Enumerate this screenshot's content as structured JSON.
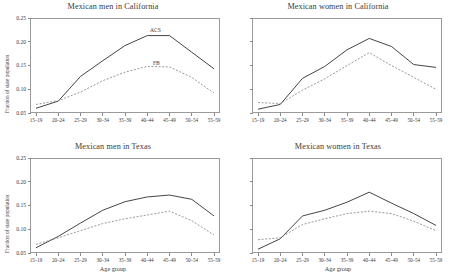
{
  "figure": {
    "xlabel": "Age group",
    "ylabel": "Fraction of state population",
    "series_label_acs": "ACS",
    "series_label_fb": "FB",
    "acs_color": "#3b3b3b",
    "fb_color": "#8d8d8d"
  },
  "chart_data": [
    {
      "type": "line",
      "title": "Mexican men in California",
      "xlabel": "Age group",
      "ylabel": "Fraction of state population",
      "categories": [
        "15–19",
        "20–24",
        "25–29",
        "30–34",
        "35–39",
        "40–44",
        "45–49",
        "50–54",
        "55–59"
      ],
      "ylim": [
        0.05,
        0.25
      ],
      "yticks": [
        0.05,
        0.1,
        0.15,
        0.2,
        0.25
      ],
      "yticklabels": [
        "0.05",
        "0.10",
        "0.15",
        "0.20",
        "0.25"
      ],
      "grid": false,
      "legend": "inline-annotation",
      "series": [
        {
          "name": "ACS",
          "style": "solid",
          "values": [
            0.06,
            0.075,
            0.127,
            0.16,
            0.192,
            0.213,
            0.213,
            0.178,
            0.143
          ]
        },
        {
          "name": "FB",
          "style": "dashed",
          "values": [
            0.068,
            0.076,
            0.094,
            0.118,
            0.136,
            0.148,
            0.147,
            0.125,
            0.092
          ]
        }
      ]
    },
    {
      "type": "line",
      "title": "Mexican women in California",
      "xlabel": "Age group",
      "ylabel": "Fraction of state population",
      "categories": [
        "15–19",
        "20–24",
        "25–29",
        "30–34",
        "35–39",
        "40–44",
        "45–49",
        "50–54",
        "55–59"
      ],
      "ylim": [
        0.05,
        0.25
      ],
      "yticks": [
        0.05,
        0.1,
        0.15,
        0.2,
        0.25
      ],
      "yticklabels": [
        "",
        "",
        "",
        "",
        ""
      ],
      "grid": false,
      "series": [
        {
          "name": "ACS",
          "style": "solid",
          "values": [
            0.058,
            0.068,
            0.123,
            0.148,
            0.183,
            0.207,
            0.19,
            0.152,
            0.146
          ]
        },
        {
          "name": "FB",
          "style": "dashed",
          "values": [
            0.072,
            0.07,
            0.098,
            0.122,
            0.15,
            0.177,
            0.15,
            0.125,
            0.1
          ]
        }
      ]
    },
    {
      "type": "line",
      "title": "Mexican men in Texas",
      "xlabel": "Age group",
      "ylabel": "Fraction of state population",
      "categories": [
        "15–19",
        "20–24",
        "25–29",
        "30–34",
        "35–39",
        "40–44",
        "45–49",
        "50–54",
        "55–59"
      ],
      "ylim": [
        0.05,
        0.25
      ],
      "yticks": [
        0.05,
        0.1,
        0.15,
        0.2,
        0.25
      ],
      "yticklabels": [
        "0.05",
        "0.10",
        "0.15",
        "0.20",
        "0.25"
      ],
      "grid": false,
      "series": [
        {
          "name": "ACS",
          "style": "solid",
          "values": [
            0.061,
            0.085,
            0.113,
            0.14,
            0.158,
            0.168,
            0.172,
            0.163,
            0.128
          ]
        },
        {
          "name": "FB",
          "style": "dashed",
          "values": [
            0.068,
            0.082,
            0.097,
            0.112,
            0.122,
            0.13,
            0.138,
            0.118,
            0.088
          ]
        }
      ]
    },
    {
      "type": "line",
      "title": "Mexican women in Texas",
      "xlabel": "Age group",
      "ylabel": "Fraction of state population",
      "categories": [
        "15–19",
        "20–24",
        "25–29",
        "30–34",
        "35–39",
        "40–44",
        "45–49",
        "50–54",
        "55–59"
      ],
      "ylim": [
        0.05,
        0.25
      ],
      "yticks": [
        0.05,
        0.1,
        0.15,
        0.2,
        0.25
      ],
      "yticklabels": [
        "",
        "",
        "",
        "",
        ""
      ],
      "grid": false,
      "series": [
        {
          "name": "ACS",
          "style": "solid",
          "values": [
            0.058,
            0.08,
            0.128,
            0.14,
            0.157,
            0.178,
            0.155,
            0.133,
            0.108
          ]
        },
        {
          "name": "FB",
          "style": "dashed",
          "values": [
            0.078,
            0.082,
            0.11,
            0.122,
            0.133,
            0.138,
            0.133,
            0.117,
            0.097
          ]
        }
      ]
    }
  ]
}
